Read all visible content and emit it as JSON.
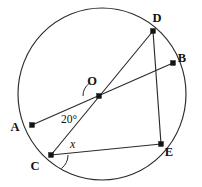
{
  "figure": {
    "background_color": "#ffffff",
    "stroke_color": "#2b2b2b",
    "label_color": "#111111",
    "circle": {
      "cx": 102,
      "cy": 94,
      "r": 84
    },
    "points": [
      {
        "id": "A",
        "label": "A",
        "x": 32,
        "y": 125,
        "label_x": 15,
        "label_y": 131,
        "dot": true
      },
      {
        "id": "B",
        "label": "B",
        "x": 173,
        "y": 63,
        "label_x": 182,
        "label_y": 62,
        "dot": true
      },
      {
        "id": "C",
        "label": "C",
        "x": 51,
        "y": 155,
        "label_x": 35,
        "label_y": 170,
        "dot": true
      },
      {
        "id": "D",
        "label": "D",
        "x": 153,
        "y": 31,
        "label_x": 157,
        "label_y": 22,
        "dot": true
      },
      {
        "id": "E",
        "label": "E",
        "x": 161,
        "y": 144,
        "label_x": 169,
        "label_y": 156,
        "dot": true
      },
      {
        "id": "O",
        "label": "O",
        "x": 99,
        "y": 96,
        "label_x": 92,
        "label_y": 85,
        "dot": true
      }
    ],
    "segments": [
      {
        "id": "AB",
        "from": "A",
        "to": "B",
        "description": "diameter through centre O"
      },
      {
        "id": "CD",
        "from": "C",
        "to": "D",
        "description": "chord through centre O"
      },
      {
        "id": "CE",
        "from": "C",
        "to": "E",
        "description": "chord"
      },
      {
        "id": "DE",
        "from": "D",
        "to": "E",
        "description": "chord"
      }
    ],
    "angles": [
      {
        "id": "angle-at-O",
        "label": "20°",
        "value": "20",
        "unit": "°",
        "vertex": "O",
        "label_x": 61,
        "label_y": 123,
        "arc_radius": 16,
        "arc_start_deg": 180,
        "arc_end_deg": 232
      },
      {
        "id": "angle-at-C",
        "label": "x",
        "value": "x",
        "unit": "",
        "vertex": "C",
        "label_x": 70,
        "label_y": 148,
        "arc_radius": 17,
        "arc_start_deg": 0,
        "arc_end_deg": 53
      }
    ]
  }
}
